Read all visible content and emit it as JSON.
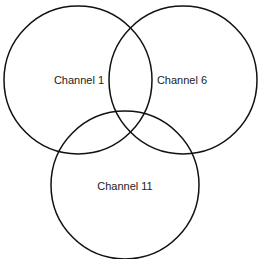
{
  "diagram": {
    "type": "venn",
    "stroke_color": "#111111",
    "circles": [
      {
        "label": "Channel 1",
        "cx": 78,
        "cy": 80,
        "r": 74,
        "label_x": 81,
        "label_y": 84
      },
      {
        "label": "Channel 6",
        "cx": 183,
        "cy": 80,
        "r": 74,
        "label_x": 183,
        "label_y": 84
      },
      {
        "label": "Channel 11",
        "cx": 125,
        "cy": 185,
        "r": 74,
        "label_x": 125,
        "label_y": 189
      }
    ]
  }
}
